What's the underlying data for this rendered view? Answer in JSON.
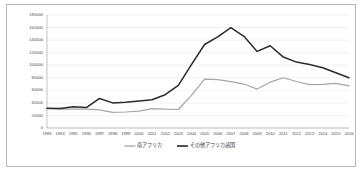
{
  "chart_data": {
    "type": "line",
    "title": "",
    "xlabel": "",
    "ylabel": "",
    "ylim": [
      0,
      180000
    ],
    "ytick_step": 20000,
    "grid": true,
    "legend_position": "bottom",
    "yticks": [
      "0",
      "20000",
      "40000",
      "60000",
      "80000",
      "100000",
      "120000",
      "140000",
      "160000",
      "180000"
    ],
    "categories": [
      "1993",
      "1994",
      "1995",
      "1996",
      "1997",
      "1998",
      "1999",
      "2000",
      "2001",
      "2002",
      "2003",
      "2004",
      "2005",
      "2006",
      "2007",
      "2008",
      "2009",
      "2010",
      "2011",
      "2012",
      "2013",
      "2014",
      "2015",
      "2016"
    ],
    "series": [
      {
        "name": "南アフリカ",
        "color": "#a6a6a6",
        "values": [
          31000,
          30000,
          30000,
          30000,
          29000,
          25000,
          25500,
          27000,
          31000,
          30000,
          29500,
          52000,
          78000,
          77000,
          74000,
          70000,
          62000,
          73000,
          80000,
          74000,
          69000,
          69500,
          71000,
          67000
        ]
      },
      {
        "name": "その他アフリカ諸国",
        "color": "#2b2b2b",
        "values": [
          31500,
          31000,
          34000,
          32500,
          47000,
          40000,
          41000,
          43000,
          45000,
          53000,
          68000,
          101000,
          133000,
          145000,
          160000,
          146000,
          122000,
          131000,
          113000,
          105000,
          101000,
          96000,
          88000,
          80000
        ]
      }
    ]
  },
  "legend": {
    "items": [
      {
        "label": "南アフリカ",
        "color": "#a6a6a6"
      },
      {
        "label": "その他アフリカ諸国",
        "color": "#2b2b2b"
      }
    ]
  }
}
